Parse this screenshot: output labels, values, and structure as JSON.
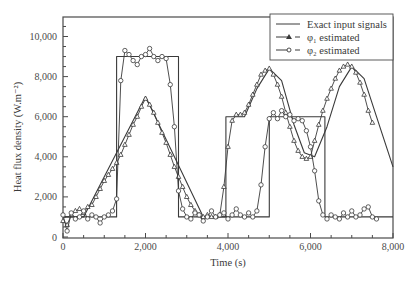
{
  "chart_data": {
    "type": "line",
    "title": "",
    "xlabel": "Time (s)",
    "ylabel": "Heat flux density (W.m⁻²)",
    "xlim": [
      0,
      8000
    ],
    "ylim": [
      0,
      11000
    ],
    "xticks": [
      0,
      2000,
      4000,
      6000,
      8000
    ],
    "xtick_labels": [
      "0",
      "2,000",
      "4,000",
      "6,000",
      "8,000"
    ],
    "yticks": [
      0,
      2000,
      4000,
      6000,
      8000,
      10000
    ],
    "ytick_labels": [
      "0",
      "2,000",
      "4,000",
      "6,000",
      "8,000",
      "10,000"
    ],
    "grid": false,
    "legend_position": "upper right",
    "legend": [
      "Exact input signals",
      "φ₁ estimated",
      "φ₂ estimated"
    ],
    "series": [
      {
        "name": "Exact input signal 1",
        "style": "solid",
        "x": [
          0,
          500,
          2000,
          3400,
          3950,
          3950,
          4400,
          4700,
          5000,
          5300,
          5600,
          5850,
          6100,
          6400,
          6700,
          7000,
          7300,
          7600,
          8000
        ],
        "y": [
          1000,
          1000,
          7000,
          1000,
          1000,
          6000,
          6000,
          7400,
          8400,
          7800,
          5600,
          4200,
          4000,
          5500,
          7500,
          8500,
          7900,
          6000,
          3500
        ]
      },
      {
        "name": "Exact input signal 2",
        "style": "solid",
        "x": [
          0,
          1300,
          1300,
          2800,
          2800,
          5000,
          5000,
          6350,
          6350,
          8000
        ],
        "y": [
          1000,
          1000,
          9000,
          9000,
          1000,
          1000,
          6000,
          6000,
          1000,
          1000
        ]
      },
      {
        "name": "φ₁ estimated",
        "marker": "triangle",
        "x": [
          0,
          100,
          200,
          300,
          400,
          500,
          600,
          700,
          800,
          900,
          1000,
          1100,
          1200,
          1300,
          1400,
          1500,
          1600,
          1700,
          1800,
          1900,
          2000,
          2100,
          2200,
          2300,
          2400,
          2500,
          2600,
          2700,
          2800,
          2900,
          3000,
          3100,
          3200,
          3300,
          3400,
          3500,
          3600,
          3700,
          3800,
          3900,
          4000,
          4100,
          4200,
          4300,
          4400,
          4500,
          4600,
          4700,
          4800,
          4900,
          5000,
          5100,
          5200,
          5300,
          5400,
          5500,
          5600,
          5700,
          5800,
          5900,
          6000,
          6100,
          6200,
          6300,
          6400,
          6500,
          6600,
          6700,
          6800,
          6900,
          7000,
          7100,
          7200,
          7300,
          7400,
          7500
        ],
        "y": [
          800,
          600,
          1100,
          1300,
          1400,
          1200,
          1500,
          1600,
          2000,
          2400,
          2800,
          3100,
          3400,
          3700,
          4100,
          4600,
          5100,
          5600,
          6000,
          6500,
          6900,
          6600,
          6200,
          5700,
          5200,
          4700,
          4100,
          3500,
          3000,
          2500,
          2000,
          1600,
          1300,
          1100,
          1000,
          1100,
          1000,
          1000,
          1100,
          2500,
          4500,
          5800,
          6100,
          6100,
          6200,
          6600,
          7100,
          7600,
          8100,
          8300,
          8400,
          8100,
          7600,
          7000,
          6200,
          5500,
          4800,
          4300,
          4000,
          3900,
          4000,
          4800,
          5600,
          6300,
          6900,
          7400,
          7900,
          8300,
          8500,
          8600,
          8500,
          8200,
          7700,
          7100,
          6300,
          5700
        ]
      },
      {
        "name": "φ₂ estimated",
        "marker": "circle",
        "x": [
          0,
          100,
          200,
          300,
          400,
          500,
          600,
          700,
          800,
          900,
          1000,
          1100,
          1200,
          1300,
          1400,
          1500,
          1600,
          1700,
          1800,
          1900,
          2000,
          2100,
          2200,
          2300,
          2400,
          2500,
          2600,
          2700,
          2800,
          2900,
          3000,
          3100,
          3200,
          3300,
          3400,
          3500,
          3600,
          3700,
          3800,
          3900,
          4000,
          4100,
          4200,
          4300,
          4400,
          4500,
          4600,
          4700,
          4800,
          4900,
          5000,
          5100,
          5200,
          5300,
          5400,
          5500,
          5600,
          5700,
          5800,
          5900,
          6000,
          6100,
          6200,
          6300,
          6400,
          6500,
          6600,
          6700,
          6800,
          6900,
          7000,
          7100,
          7200,
          7300,
          7400,
          7500,
          7600
        ],
        "y": [
          1100,
          300,
          1200,
          900,
          1000,
          1300,
          900,
          1100,
          1000,
          700,
          1000,
          1100,
          1300,
          1900,
          7800,
          9300,
          9100,
          8800,
          8600,
          9000,
          9100,
          9400,
          9000,
          8800,
          9000,
          8900,
          7600,
          5500,
          2300,
          1400,
          1000,
          900,
          1200,
          1100,
          800,
          1000,
          1300,
          1000,
          1100,
          1200,
          900,
          1100,
          1400,
          1100,
          1000,
          1200,
          1000,
          1300,
          2600,
          4500,
          5900,
          6200,
          5900,
          6300,
          6000,
          6100,
          5800,
          5900,
          5800,
          5300,
          4500,
          3300,
          1800,
          1100,
          900,
          1100,
          1000,
          900,
          1200,
          1000,
          1300,
          1000,
          1100,
          1400,
          1500,
          1000,
          900
        ]
      }
    ]
  }
}
